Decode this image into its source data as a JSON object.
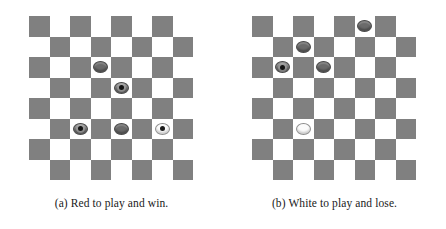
{
  "figure": {
    "type": "checkers-diagram",
    "board_size": 8,
    "colors": {
      "dark_square": "#808080",
      "light_square": "#ffffff",
      "dark_piece": "#6b6b6b",
      "white_piece": "#fbfbfb",
      "crown_dot": "#141414"
    }
  },
  "panels": [
    {
      "id": "a",
      "caption": "(a) Red to play and win.",
      "pieces": [
        {
          "row": 2,
          "col": 3,
          "color": "dark",
          "king": false
        },
        {
          "row": 3,
          "col": 4,
          "color": "dark",
          "king": true
        },
        {
          "row": 5,
          "col": 2,
          "color": "dark",
          "king": true
        },
        {
          "row": 5,
          "col": 4,
          "color": "dark",
          "king": false
        },
        {
          "row": 5,
          "col": 6,
          "color": "white",
          "king": true
        }
      ]
    },
    {
      "id": "b",
      "caption": "(b) White to play and lose.",
      "pieces": [
        {
          "row": 0,
          "col": 5,
          "color": "dark",
          "king": false
        },
        {
          "row": 1,
          "col": 2,
          "color": "dark",
          "king": false
        },
        {
          "row": 2,
          "col": 1,
          "color": "dark",
          "king": true
        },
        {
          "row": 2,
          "col": 3,
          "color": "dark",
          "king": false
        },
        {
          "row": 5,
          "col": 2,
          "color": "white",
          "king": false
        }
      ]
    }
  ]
}
